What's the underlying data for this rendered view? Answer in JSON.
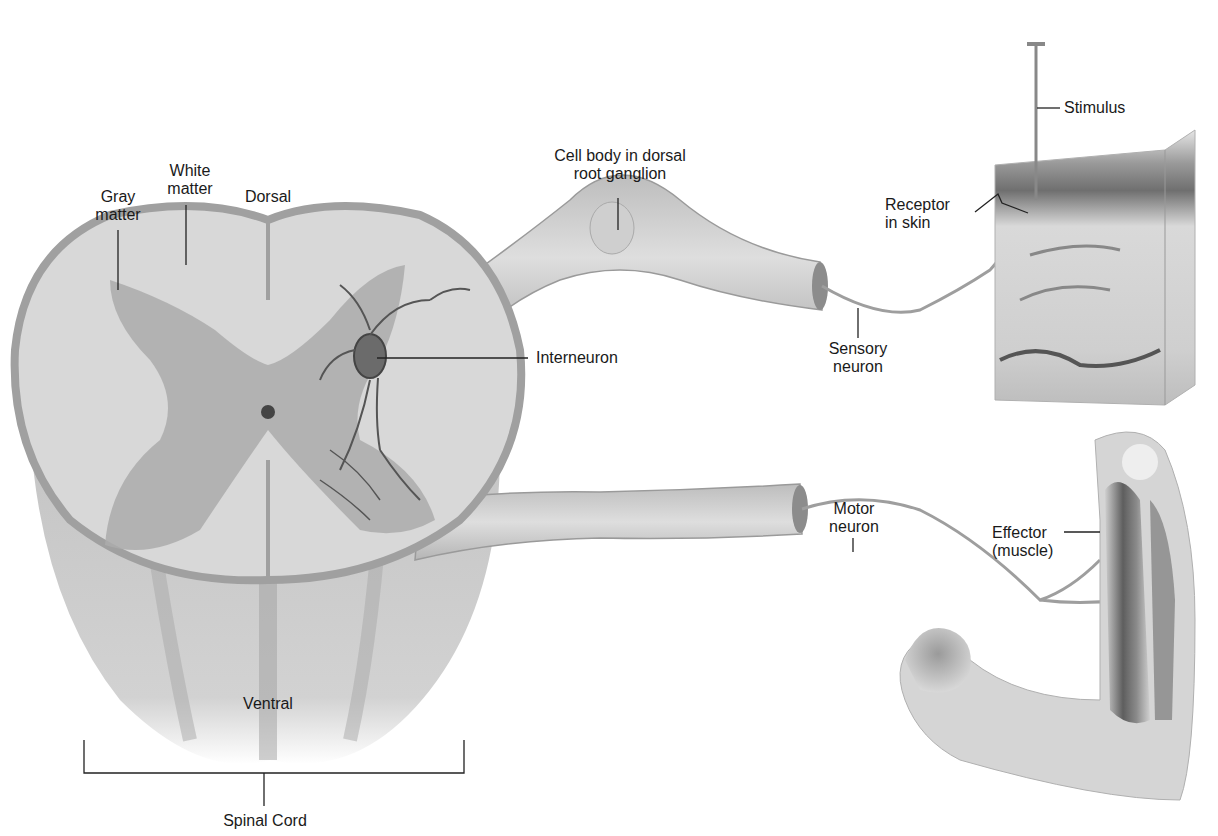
{
  "diagram": {
    "labels": {
      "gray_matter": "Gray\nmatter",
      "white_matter": "White\nmatter",
      "dorsal": "Dorsal",
      "cell_body": "Cell body in dorsal\nroot ganglion",
      "stimulus": "Stimulus",
      "receptor": "Receptor\nin skin",
      "interneuron": "Interneuron",
      "sensory_neuron": "Sensory\nneuron",
      "motor_neuron": "Motor\nneuron",
      "effector": "Effector\n(muscle)",
      "ventral": "Ventral",
      "spinal_cord": "Spinal Cord"
    },
    "colors": {
      "background": "#ffffff",
      "tissue_light": "#dcdcdc",
      "tissue_mid": "#b8b8b8",
      "gray_matter": "#a9a9a9",
      "nerve": "#c8c8c8",
      "neuron_dark": "#555555",
      "label_line": "#222222"
    }
  }
}
